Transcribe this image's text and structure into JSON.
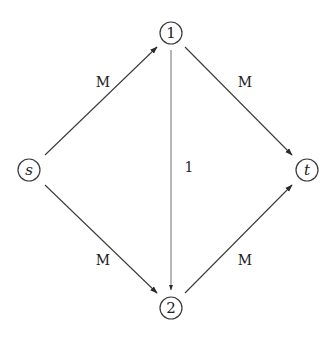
{
  "diagram": {
    "type": "directed-flow-network",
    "nodes": [
      {
        "id": "s",
        "label": "s",
        "italic": true,
        "x": 29,
        "y": 170
      },
      {
        "id": "1",
        "label": "1",
        "italic": false,
        "x": 171,
        "y": 33
      },
      {
        "id": "2",
        "label": "2",
        "italic": false,
        "x": 171,
        "y": 308
      },
      {
        "id": "t",
        "label": "t",
        "italic": true,
        "x": 307,
        "y": 170
      }
    ],
    "edges": [
      {
        "from": "s",
        "to": "1",
        "label": "M"
      },
      {
        "from": "1",
        "to": "t",
        "label": "M"
      },
      {
        "from": "1",
        "to": "2",
        "label": "1"
      },
      {
        "from": "s",
        "to": "2",
        "label": "M"
      },
      {
        "from": "2",
        "to": "t",
        "label": "M"
      }
    ],
    "colors": {
      "stroke": "#3a3a3a",
      "text": "#222222",
      "background": "#ffffff"
    }
  }
}
